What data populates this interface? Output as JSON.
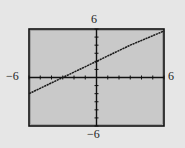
{
  "window_labels": {
    "ymax": "6",
    "ymin": "−6",
    "xmin": "−6",
    "xmax": "6"
  },
  "colors": {
    "page_background": "#e6e6e6",
    "plot_background": "#c9c9c9",
    "frame": "#111111",
    "axes": "#111111",
    "line": "#1a1a1a"
  },
  "chart_data": {
    "type": "line",
    "title": "",
    "xlabel": "",
    "ylabel": "",
    "xlim": [
      -6,
      6
    ],
    "ylim": [
      -6,
      6
    ],
    "xscale": 1,
    "yscale": 1,
    "grid": false,
    "axis_labels_shown": {
      "xmin": "-6",
      "xmax": "6",
      "ymin": "-6",
      "ymax": "6"
    },
    "series": [
      {
        "name": "y = (2/3)x + 2",
        "equation": "y = (2/3)x + 2",
        "slope": 0.6667,
        "y_intercept": 2,
        "x_intercept": -3,
        "x": [
          -6,
          -3,
          0,
          3,
          6
        ],
        "y": [
          -2,
          0,
          2,
          4,
          6
        ]
      }
    ]
  }
}
